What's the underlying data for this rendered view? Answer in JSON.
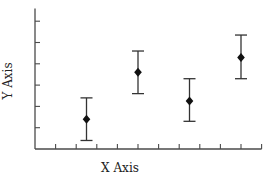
{
  "chart_data": {
    "type": "scatter",
    "title": "",
    "xlabel": "X Axis",
    "ylabel": "Y Axis",
    "xlim": [
      0,
      11
    ],
    "ylim": [
      0,
      6.6
    ],
    "x_tick_count": 11,
    "y_tick_count": 6,
    "x_tick_labels": [],
    "y_tick_labels": [],
    "grid": false,
    "legend": null,
    "marker": "diamond",
    "error_bars": true,
    "series": [
      {
        "name": "data",
        "points": [
          {
            "x": 2.5,
            "y": 1.4,
            "err_low": 0.4,
            "err_high": 2.4
          },
          {
            "x": 5.0,
            "y": 3.6,
            "err_low": 2.6,
            "err_high": 4.6
          },
          {
            "x": 7.5,
            "y": 2.25,
            "err_low": 1.3,
            "err_high": 3.3
          },
          {
            "x": 10.0,
            "y": 4.3,
            "err_low": 3.3,
            "err_high": 5.35
          }
        ]
      }
    ]
  },
  "colors": {
    "axis": "#4a4a4a",
    "marker": "#111111",
    "error_bar": "#333333",
    "background": "#ffffff"
  }
}
